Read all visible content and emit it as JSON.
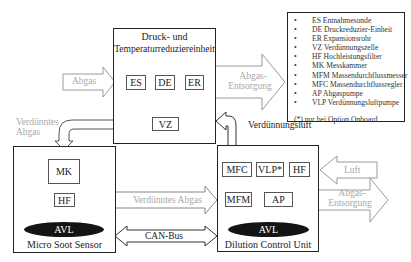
{
  "diagram": {
    "units": {
      "pressure_unit": {
        "title_line1": "Druck- und",
        "title_line2": "Temperaturreduziereinheit",
        "components": [
          "ES",
          "DE",
          "ER",
          "VZ"
        ]
      },
      "micro_soot_sensor": {
        "title": "Micro Soot Sensor",
        "logo": "AVL",
        "components": [
          "MK",
          "HF"
        ]
      },
      "dilution_control_unit": {
        "title": "Dilution Control Unit",
        "logo": "AVL",
        "components": [
          "MFC",
          "VLP*",
          "HF",
          "MFM",
          "AP"
        ]
      }
    },
    "flows": {
      "abgas_in": "Abgas",
      "abgas_out_top_line1": "Abgas-",
      "abgas_out_top_line2": "Entsorgung",
      "verduenntes_abgas_left_line1": "Verdünntes",
      "verduenntes_abgas_left_line2": "Abgas",
      "verduenntes_abgas_mid": "Verdünntes Abgas",
      "verduennungsluft": "Verdünnungsluft",
      "luft": "Luft",
      "abgas_out_bottom_line1": "Abgas-",
      "abgas_out_bottom_line2": "Entsorgung",
      "can_bus": "CAN-Bus"
    },
    "legend": {
      "items": [
        "ES Entnahmesonde",
        "DE Druckreduzier-Einheit",
        "ER Expansionsrohr",
        "VZ Verdünnungszelle",
        "HF Hochleistungsfilter",
        "MK Messkammer",
        "MFM Massendurchflussmesser",
        "MFC Massendurchflussregler",
        "AP Abgaspumpe",
        "VLP Verdünnungsluftpumpe"
      ],
      "bullet": "•",
      "note": "(*) nur bei Option Onboard"
    },
    "colors": {
      "line": "#222222",
      "gray_flow": "#a8a8a8",
      "logo_fill": "#141414"
    }
  }
}
